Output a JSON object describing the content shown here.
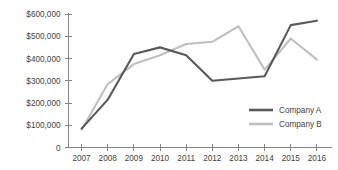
{
  "chart_data": {
    "type": "line",
    "title": "",
    "xlabel": "",
    "ylabel": "",
    "categories": [
      "2007",
      "2008",
      "2009",
      "2010",
      "2011",
      "2012",
      "2013",
      "2014",
      "2015",
      "2016"
    ],
    "ylim": [
      0,
      600000
    ],
    "ytick_values": [
      0,
      100000,
      200000,
      300000,
      400000,
      500000,
      600000
    ],
    "ytick_labels": [
      "0",
      "$100,000",
      "$200,000",
      "$300,000",
      "$400,000",
      "$500,000",
      "$600,000"
    ],
    "grid": false,
    "legend_position": "right-inside",
    "series": [
      {
        "name": "Company A",
        "color": "#595959",
        "line_width": 2.1,
        "values": [
          85000,
          215000,
          420000,
          450000,
          415000,
          300000,
          310000,
          320000,
          550000,
          570000
        ]
      },
      {
        "name": "Company B",
        "color": "#bfbfbf",
        "line_width": 2.1,
        "values": [
          80000,
          285000,
          375000,
          415000,
          465000,
          475000,
          545000,
          350000,
          490000,
          395000
        ]
      }
    ]
  },
  "legend": {
    "items": [
      {
        "label": "Company A",
        "color": "#595959"
      },
      {
        "label": "Company B",
        "color": "#bfbfbf"
      }
    ]
  },
  "colors": {
    "axis": "#868686",
    "text": "#3f3f3f",
    "background": "#ffffff",
    "series_a": "#595959",
    "series_b": "#bfbfbf"
  }
}
